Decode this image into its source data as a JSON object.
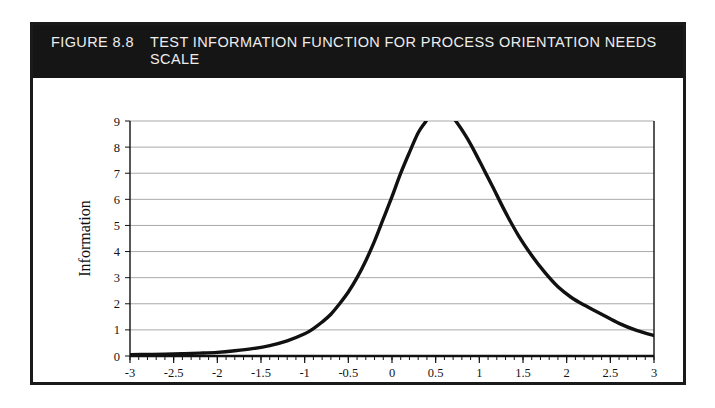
{
  "figure": {
    "number": "FIGURE 8.8",
    "caption": "TEST INFORMATION FUNCTION FOR PROCESS ORIENTATION NEEDS SCALE",
    "banner_color": "#151515",
    "banner_text_color": "#ededed",
    "frame_color": "#1a1a1a"
  },
  "chart_data": {
    "type": "line",
    "title": "TEST INFORMATION FUNCTION FOR PROCESS ORIENTATION NEEDS SCALE",
    "xlabel": "Theta",
    "ylabel": "Information",
    "xlim": [
      -3,
      3
    ],
    "ylim": [
      0,
      9
    ],
    "grid": "horizontal",
    "legend": "none",
    "line_color": "#111111",
    "grid_color": "#a9a9a9",
    "axis_color": "#111111",
    "xticks": [
      -3,
      -2.5,
      -2,
      -1.5,
      -1,
      -0.5,
      0,
      0.5,
      1,
      1.5,
      2,
      2.5,
      3
    ],
    "xtick_labels": [
      "-3",
      "-2.5",
      "-2",
      "-1.5",
      "-1",
      "-0.5",
      "0",
      "0.5",
      "1",
      "1.5",
      "2",
      "2.5",
      "3"
    ],
    "yticks": [
      0,
      1,
      2,
      3,
      4,
      5,
      6,
      7,
      8,
      9
    ],
    "ytick_labels": [
      "0",
      "1",
      "2",
      "3",
      "4",
      "5",
      "6",
      "7",
      "8",
      "9"
    ],
    "note": "Curve is clipped at the top of the axis (Information = 9); peak exceeds the plotted range between Theta 0.39 and 0.73.",
    "clipped_at_top": true,
    "clip_range_theta": [
      0.39,
      0.73
    ],
    "x": [
      -3.0,
      -2.8,
      -2.6,
      -2.4,
      -2.2,
      -2.0,
      -1.8,
      -1.6,
      -1.4,
      -1.2,
      -1.0,
      -0.9,
      -0.8,
      -0.7,
      -0.6,
      -0.5,
      -0.4,
      -0.3,
      -0.2,
      -0.1,
      0.0,
      0.1,
      0.2,
      0.3,
      0.39,
      0.5,
      0.6,
      0.73,
      0.85,
      0.95,
      1.05,
      1.15,
      1.3,
      1.45,
      1.6,
      1.75,
      1.9,
      2.05,
      2.2,
      2.4,
      2.6,
      2.8,
      3.0
    ],
    "y": [
      0.05,
      0.06,
      0.07,
      0.09,
      0.11,
      0.14,
      0.2,
      0.28,
      0.4,
      0.58,
      0.85,
      1.05,
      1.3,
      1.6,
      2.0,
      2.45,
      3.0,
      3.65,
      4.4,
      5.25,
      6.1,
      7.0,
      7.8,
      8.55,
      9.0,
      9.6,
      9.5,
      9.0,
      8.4,
      7.8,
      7.15,
      6.5,
      5.5,
      4.6,
      3.85,
      3.2,
      2.65,
      2.25,
      1.95,
      1.6,
      1.25,
      0.98,
      0.78
    ]
  }
}
